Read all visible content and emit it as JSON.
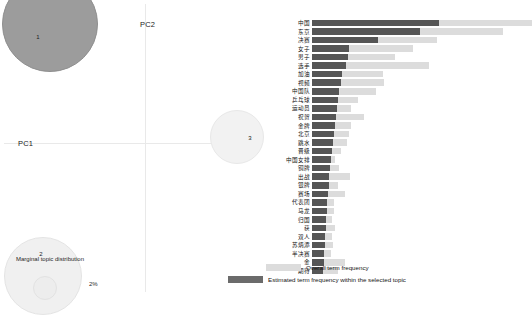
{
  "left_panel": {
    "name": "intertopic-distance-map",
    "axes": {
      "x_label": "PC1",
      "y_label": "PC2"
    },
    "marginal_caption": "Marginal topic distribution",
    "marginal_pct": "2%",
    "topics": [
      {
        "id": "1",
        "label": "1"
      },
      {
        "id": "2",
        "label": "2"
      },
      {
        "id": "3",
        "label": "3"
      }
    ]
  },
  "right_panel": {
    "name": "term-frequency-bar-chart",
    "legend": {
      "overall_label": "Overall term frequency",
      "topic_label": "Estimated term frequency within the selected topic",
      "overall_color": "#dcdcdc",
      "topic_color": "#6b6b6b"
    }
  },
  "chart_data": {
    "type": "bar",
    "title": "",
    "xlabel": "",
    "ylabel": "",
    "orientation": "horizontal",
    "legend_position": "bottom-right",
    "grid": false,
    "xlim": [
      0,
      220
    ],
    "categories": [
      "中国",
      "东京",
      "决赛",
      "女子",
      "男子",
      "选手",
      "加油",
      "视频",
      "中国队",
      "乒乓球",
      "运动员",
      "祝贺",
      "金牌",
      "北京",
      "跳水",
      "晋级",
      "中国女排",
      "铜牌",
      "出战",
      "银牌",
      "赛场",
      "代表团",
      "马龙",
      "归国",
      "获",
      "双人",
      "苏炳添",
      "半决赛",
      "金",
      "期待"
    ],
    "series": [
      {
        "name": "Overall term frequency",
        "color": "#dcdcdc",
        "values": [
          220,
          191,
          125,
          101,
          83,
          117,
          71,
          72,
          64,
          46,
          39,
          52,
          39,
          37,
          35,
          29,
          23,
          27,
          38,
          26,
          33,
          22,
          22,
          20,
          23,
          20,
          21,
          19,
          33,
          26
        ]
      },
      {
        "name": "Estimated term frequency within the selected topic",
        "color": "#565656",
        "values": [
          127,
          108,
          66,
          37,
          36,
          34,
          30,
          29,
          27,
          26,
          25,
          24,
          23,
          22,
          21,
          20,
          19,
          18,
          17,
          17,
          16,
          15,
          15,
          14,
          14,
          13,
          13,
          12,
          12,
          11
        ]
      }
    ]
  }
}
